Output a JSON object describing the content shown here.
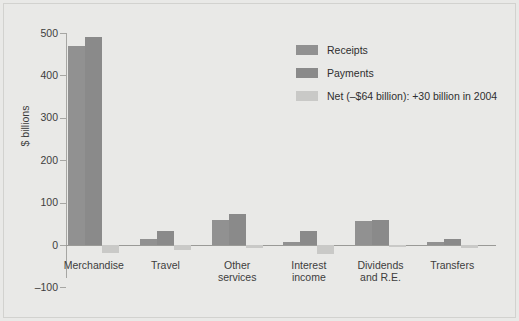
{
  "chart_data": {
    "type": "bar",
    "title": "",
    "subtitle": "",
    "xlabel": "",
    "ylabel": "$ billions",
    "ylim": [
      -100,
      500
    ],
    "yticks": [
      500,
      400,
      300,
      200,
      100,
      0,
      -100
    ],
    "ytick_labels": [
      "500",
      "400",
      "300",
      "200",
      "100",
      "0",
      "–100"
    ],
    "grid": false,
    "legend_position": "top-right",
    "categories": [
      "Merchandise",
      "Travel",
      "Other\nservices",
      "Interest\nincome",
      "Dividends\nand R.E.",
      "Transfers"
    ],
    "series": [
      {
        "name": "Receipts",
        "color": "#919191",
        "values": [
          470,
          15,
          58,
          8,
          57,
          8
        ]
      },
      {
        "name": "Payments",
        "color": "#8a8a8a",
        "values": [
          490,
          32,
          72,
          32,
          60,
          14
        ]
      },
      {
        "name": "Net",
        "color": "#c9c9c7",
        "values": [
          -20,
          -12,
          -8,
          -22,
          -3,
          -6
        ]
      }
    ],
    "legend_entries": [
      "Receipts",
      "Payments",
      "Net (–$64 billion): +30 billion in 2004"
    ],
    "annotations": []
  },
  "colors": {
    "background": "#e9e9e7",
    "axis": "#a6a6a3",
    "text": "#3d3d3d",
    "receipts": "#919191",
    "payments": "#8a8a8a",
    "net": "#c9c9c7"
  }
}
